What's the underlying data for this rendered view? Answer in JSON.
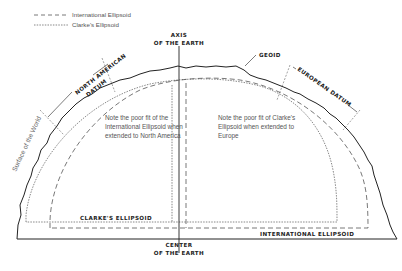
{
  "legend": {
    "items": [
      {
        "label": "International Ellipsoid",
        "style": "dashed"
      },
      {
        "label": "Clarke's Ellipsoid",
        "style": "dotted"
      }
    ]
  },
  "labels": {
    "axis_line1": "AXIS",
    "axis_line2": "OF THE EARTH",
    "geoid": "GEOID",
    "north_american_datum_line1": "NORTH AMERICAN",
    "north_american_datum_line2": "DATUM",
    "european_datum": "EUROPEAN DATUM",
    "surface": "Surface of the World",
    "clarkes_ellipsoid": "CLARKE'S ELLIPSOID",
    "international_ellipsoid": "INTERNATIONAL ELLIPSOID",
    "center_line1": "CENTER",
    "center_line2": "OF THE EARTH"
  },
  "notes": {
    "left": [
      "Note the poor fit of the",
      "International Ellipsoid when",
      "extended to North America"
    ],
    "right": [
      "Note the poor fit of Clarke's",
      "Ellipsoid when extended to",
      "Europe"
    ]
  },
  "colors": {
    "line": "#222222",
    "dashed": "#555555",
    "text": "#555555"
  }
}
